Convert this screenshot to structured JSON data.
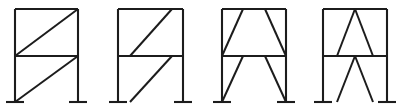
{
  "figure": {
    "frame_count": 4,
    "line_color": "#1c1c1c",
    "background_color": "#ffffff",
    "canvas": {
      "width": 397,
      "height": 112
    }
  },
  "geometry": {
    "top_y": 9,
    "mid_y": 56,
    "base_y": 102,
    "base_plate_half_width": 9
  },
  "frames": [
    {
      "id": "frame-1",
      "name": "single-diagonal-corner-to-corner",
      "label": "",
      "left_x": 15,
      "right_x": 78,
      "columns": [
        {
          "name": "left-column",
          "x": 15,
          "y1": 9,
          "y2": 102
        },
        {
          "name": "right-column",
          "x": 78,
          "y1": 9,
          "y2": 102
        }
      ],
      "beams": [
        {
          "name": "roof-beam",
          "x1": 15,
          "y1": 9,
          "x2": 78,
          "y2": 9
        },
        {
          "name": "mid-beam",
          "x1": 15,
          "y1": 56,
          "x2": 78,
          "y2": 56
        }
      ],
      "braces": [
        {
          "name": "upper-diagonal-brace",
          "x1": 15,
          "y1": 56,
          "x2": 78,
          "y2": 9
        },
        {
          "name": "lower-diagonal-brace",
          "x1": 15,
          "y1": 102,
          "x2": 78,
          "y2": 56
        }
      ],
      "base_plates": [
        {
          "name": "left-base-plate",
          "x": 15,
          "y": 102
        },
        {
          "name": "right-base-plate",
          "x": 78,
          "y": 102
        }
      ]
    },
    {
      "id": "frame-2",
      "name": "single-diagonal-offset-from-corners",
      "label": "",
      "left_x": 118,
      "right_x": 183,
      "columns": [
        {
          "name": "left-column",
          "x": 118,
          "y1": 9,
          "y2": 102
        },
        {
          "name": "right-column",
          "x": 183,
          "y1": 9,
          "y2": 102
        }
      ],
      "beams": [
        {
          "name": "roof-beam",
          "x1": 118,
          "y1": 9,
          "x2": 183,
          "y2": 9
        },
        {
          "name": "mid-beam",
          "x1": 118,
          "y1": 56,
          "x2": 183,
          "y2": 56
        }
      ],
      "braces": [
        {
          "name": "upper-diagonal-brace",
          "x1": 130,
          "y1": 56,
          "x2": 172,
          "y2": 9
        },
        {
          "name": "lower-diagonal-brace",
          "x1": 130,
          "y1": 102,
          "x2": 172,
          "y2": 56
        }
      ],
      "base_plates": [
        {
          "name": "left-base-plate",
          "x": 118,
          "y": 102
        },
        {
          "name": "right-base-plate",
          "x": 183,
          "y": 102
        }
      ]
    },
    {
      "id": "frame-3",
      "name": "v-brace-splayed-outward",
      "label": "",
      "left_x": 222,
      "right_x": 286,
      "columns": [
        {
          "name": "left-column",
          "x": 222,
          "y1": 9,
          "y2": 102
        },
        {
          "name": "right-column",
          "x": 286,
          "y1": 9,
          "y2": 102
        }
      ],
      "beams": [
        {
          "name": "roof-beam",
          "x1": 222,
          "y1": 9,
          "x2": 286,
          "y2": 9
        },
        {
          "name": "mid-beam",
          "x1": 222,
          "y1": 56,
          "x2": 286,
          "y2": 56
        }
      ],
      "braces": [
        {
          "name": "upper-left-brace",
          "x1": 222,
          "y1": 56,
          "x2": 243,
          "y2": 9
        },
        {
          "name": "upper-right-brace",
          "x1": 286,
          "y1": 56,
          "x2": 265,
          "y2": 9
        },
        {
          "name": "lower-left-brace",
          "x1": 222,
          "y1": 102,
          "x2": 243,
          "y2": 56
        },
        {
          "name": "lower-right-brace",
          "x1": 286,
          "y1": 102,
          "x2": 265,
          "y2": 56
        }
      ],
      "base_plates": [
        {
          "name": "left-base-plate",
          "x": 222,
          "y": 102
        },
        {
          "name": "right-base-plate",
          "x": 286,
          "y": 102
        }
      ]
    },
    {
      "id": "frame-4",
      "name": "inverted-v-chevron-brace",
      "label": "",
      "left_x": 323,
      "right_x": 387,
      "columns": [
        {
          "name": "left-column",
          "x": 323,
          "y1": 9,
          "y2": 102
        },
        {
          "name": "right-column",
          "x": 387,
          "y1": 9,
          "y2": 102
        }
      ],
      "beams": [
        {
          "name": "roof-beam",
          "x1": 323,
          "y1": 9,
          "x2": 387,
          "y2": 9
        },
        {
          "name": "mid-beam",
          "x1": 323,
          "y1": 56,
          "x2": 387,
          "y2": 56
        }
      ],
      "braces": [
        {
          "name": "upper-left-brace",
          "x1": 337,
          "y1": 56,
          "x2": 355,
          "y2": 9
        },
        {
          "name": "upper-right-brace",
          "x1": 373,
          "y1": 56,
          "x2": 355,
          "y2": 9
        },
        {
          "name": "lower-left-brace",
          "x1": 337,
          "y1": 102,
          "x2": 355,
          "y2": 56
        },
        {
          "name": "lower-right-brace",
          "x1": 373,
          "y1": 102,
          "x2": 355,
          "y2": 56
        }
      ],
      "base_plates": [
        {
          "name": "left-base-plate",
          "x": 323,
          "y": 102
        },
        {
          "name": "right-base-plate",
          "x": 387,
          "y": 102
        }
      ]
    }
  ]
}
